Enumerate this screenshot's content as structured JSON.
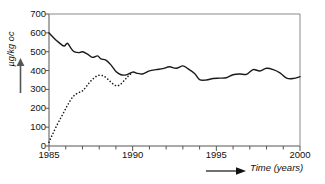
{
  "chart_data": {
    "type": "line",
    "title": "",
    "xlabel": "Time (years)",
    "ylabel": "µg/kg oc",
    "xlim": [
      1985,
      2000
    ],
    "ylim": [
      0,
      700
    ],
    "grid": false,
    "legend": "none",
    "xticks": [
      "1985",
      "1990",
      "1995",
      "2000"
    ],
    "xtick_values": [
      1985,
      1990,
      1995,
      2000
    ],
    "xminor_step": 1,
    "yticks": [
      "0",
      "100",
      "200",
      "300",
      "400",
      "500",
      "600",
      "700"
    ],
    "ytick_values": [
      0,
      100,
      200,
      300,
      400,
      500,
      600,
      700
    ],
    "series": [
      {
        "name": "solid-curve",
        "style": "solid",
        "color": "#1a1a1a",
        "x": [
          1985.0,
          1985.3,
          1985.6,
          1985.9,
          1986.1,
          1986.3,
          1986.5,
          1986.8,
          1987.0,
          1987.3,
          1987.6,
          1987.9,
          1988.1,
          1988.4,
          1988.7,
          1989.0,
          1989.3,
          1989.6,
          1990.0,
          1990.3,
          1990.6,
          1991.0,
          1991.4,
          1991.8,
          1992.2,
          1992.6,
          1993.0,
          1993.3,
          1993.7,
          1994.0,
          1994.4,
          1994.8,
          1995.2,
          1995.6,
          1996.0,
          1996.4,
          1996.8,
          1997.2,
          1997.6,
          1998.0,
          1998.4,
          1998.8,
          1999.2,
          1999.6,
          2000.0
        ],
        "y": [
          600,
          572,
          548,
          530,
          545,
          520,
          500,
          495,
          500,
          487,
          470,
          478,
          462,
          455,
          430,
          395,
          378,
          377,
          392,
          385,
          382,
          398,
          405,
          410,
          420,
          412,
          425,
          410,
          385,
          352,
          350,
          358,
          360,
          362,
          378,
          382,
          380,
          405,
          398,
          412,
          405,
          388,
          360,
          358,
          368
        ]
      },
      {
        "name": "dotted-curve",
        "style": "dotted",
        "color": "#1a1a1a",
        "x": [
          1985.0,
          1985.2,
          1985.5,
          1985.8,
          1986.1,
          1986.4,
          1986.7,
          1987.0,
          1987.25,
          1987.5,
          1987.8,
          1988.0,
          1988.25,
          1988.5,
          1988.75,
          1989.0,
          1989.25,
          1989.5,
          1989.75,
          1990.0
        ],
        "y": [
          20,
          60,
          115,
          165,
          215,
          258,
          280,
          292,
          318,
          345,
          368,
          375,
          372,
          355,
          335,
          320,
          325,
          348,
          372,
          390
        ]
      }
    ]
  }
}
